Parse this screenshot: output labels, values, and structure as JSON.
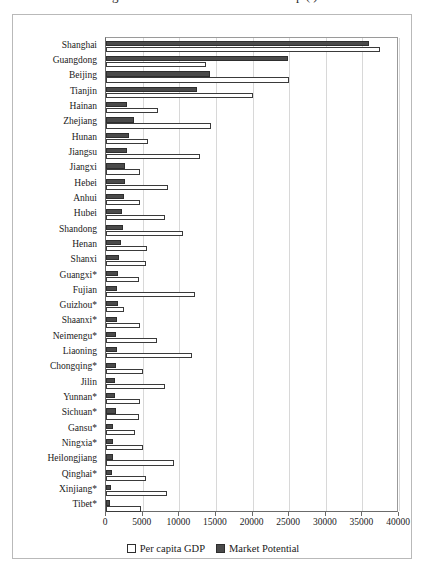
{
  "figure": {
    "title_cropped_left": "g",
    "title_cropped_right": "p     (    )"
  },
  "legend": {
    "position": "bottom-center",
    "items": [
      {
        "label": "Per capita GDP",
        "color": "#ffffff",
        "key": "gdp"
      },
      {
        "label": "Market Potential",
        "color": "#4a4a4a",
        "key": "mp"
      }
    ]
  },
  "axis": {
    "x_ticks": [
      "0",
      "5000",
      "10000",
      "15000",
      "20000",
      "25000",
      "30000",
      "35000",
      "40000"
    ],
    "x_tick_values": [
      0,
      5000,
      10000,
      15000,
      20000,
      25000,
      30000,
      35000,
      40000
    ],
    "x_min": 0,
    "x_max": 40000
  },
  "chart_data": {
    "type": "bar",
    "orientation": "horizontal",
    "title": "",
    "xlabel": "",
    "ylabel": "",
    "xlim": [
      0,
      40000
    ],
    "grid": true,
    "legend_position": "bottom-center",
    "categories": [
      "Shanghai",
      "Guangdong",
      "Beijing",
      "Tianjin",
      "Hainan",
      "Zhejiang",
      "Hunan",
      "Jiangsu",
      "Jiangxi",
      "Hebei",
      "Anhui",
      "Hubei",
      "Shandong",
      "Henan",
      "Shanxi",
      "Guangxi*",
      "Fujian",
      "Guizhou*",
      "Shaanxi*",
      "Neimengu*",
      "Liaoning",
      "Chongqing*",
      "Jilin",
      "Yunnan*",
      "Sichuan*",
      "Gansu*",
      "Ningxia*",
      "Heilongjiang",
      "Qinghai*",
      "Xinjiang*",
      "Tibet*"
    ],
    "series": [
      {
        "name": "Per capita GDP",
        "key": "gdp",
        "color": "#ffffff",
        "values": [
          37400,
          13700,
          25000,
          20000,
          7100,
          14300,
          5700,
          12800,
          4700,
          8400,
          4700,
          8000,
          10500,
          5600,
          5500,
          4500,
          12200,
          2400,
          4600,
          7000,
          11800,
          5000,
          8000,
          4600,
          4500,
          3900,
          5000,
          9300,
          5500,
          8300,
          4800
        ]
      },
      {
        "name": "Market Potential",
        "key": "mp",
        "color": "#4a4a4a",
        "values": [
          35900,
          24800,
          14200,
          12400,
          2800,
          3800,
          3200,
          2900,
          2600,
          2600,
          2400,
          2200,
          2300,
          2100,
          1800,
          1700,
          1500,
          1700,
          1500,
          1400,
          1500,
          1300,
          1200,
          1200,
          1300,
          1000,
          900,
          1000,
          800,
          700,
          600
        ]
      }
    ]
  }
}
